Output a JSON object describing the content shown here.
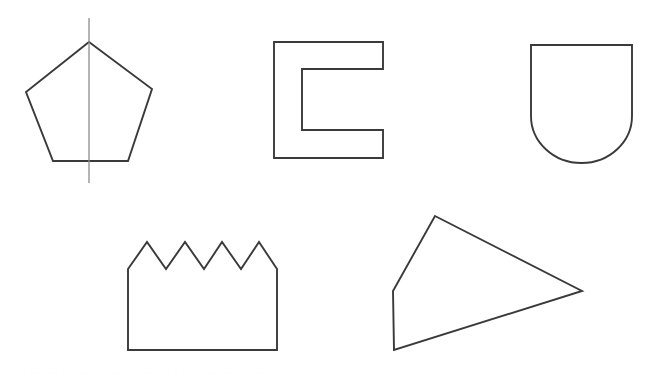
{
  "page": {
    "width": 655,
    "height": 380,
    "background_color": "#ffffff",
    "stroke_color": "#3a3a3c",
    "symmetry_line_color": "#8d8d90"
  },
  "shapes": [
    {
      "id": "pentagon",
      "name": "Regular pentagon with vertical line of symmetry",
      "type": "polygon",
      "points": "89,42 152,89 128,161 53,161 26,92",
      "label": "pentagon"
    },
    {
      "id": "c-shape",
      "name": "C-shaped bracket polygon",
      "type": "polygon",
      "points": "274,42 383,42 383,69 302,69 302,130 383,130 383,158 274,158",
      "label": "c-shape"
    },
    {
      "id": "shield",
      "name": "Shield with flat top and semicircular bottom",
      "type": "path",
      "d": "M531,45 L632,45 L632,116 A50.5,47 0 0 1 531,116 Z",
      "label": "shield"
    },
    {
      "id": "crown",
      "name": "Crown with four pointed peaks",
      "type": "polygon",
      "points": "128,269 147,242 166,269 185,242 204,269 222,242 241,269 259,242 277,269 277,350 128,350",
      "label": "crown"
    },
    {
      "id": "quadrilateral",
      "name": "Irregular convex quadrilateral kite",
      "type": "polygon",
      "points": "435,216 582,291 394,350 393,291",
      "label": "quadrilateral"
    }
  ],
  "annotations": {
    "symmetry_line": {
      "name": "Vertical line of symmetry through pentagon",
      "x1": 89,
      "y1": 18,
      "x2": 89,
      "y2": 183
    }
  },
  "footer": {
    "scan_artifact_text": "· · ·  · ·· ·  ·· · ·· ·· ·· ·  ·· ·· · ·· · ·· · · ·· · ·· ··· ·· · ·· ·"
  }
}
